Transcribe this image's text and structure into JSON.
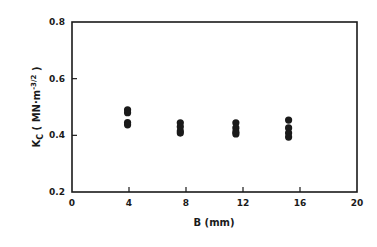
{
  "chart_data": {
    "type": "scatter",
    "title": "",
    "xlabel": "B (mm)",
    "ylabel": "K_C (MN·m^-3/2)",
    "ylabel_parts": {
      "main": "K",
      "sub": "C",
      "units_open": " ( MN·m",
      "sup": "-3/2",
      "units_close": " )"
    },
    "xlim": [
      0,
      20
    ],
    "ylim": [
      0.2,
      0.8
    ],
    "xticks": [
      0,
      4,
      8,
      12,
      16,
      20
    ],
    "yticks": [
      0.2,
      0.4,
      0.6,
      0.8
    ],
    "xtick_labels": [
      "0",
      "4",
      "8",
      "12",
      "16",
      "20"
    ],
    "ytick_labels": [
      "0.2",
      "0.4",
      "0.6",
      "0.8"
    ],
    "grid": false,
    "legend": null,
    "marker_color": "#1a1a1a",
    "series": [
      {
        "name": "K_C vs B",
        "points": [
          {
            "x": 3.9,
            "y": 0.49
          },
          {
            "x": 3.9,
            "y": 0.48
          },
          {
            "x": 3.9,
            "y": 0.445
          },
          {
            "x": 3.9,
            "y": 0.437
          },
          {
            "x": 7.6,
            "y": 0.444
          },
          {
            "x": 7.6,
            "y": 0.43
          },
          {
            "x": 7.6,
            "y": 0.415
          },
          {
            "x": 7.6,
            "y": 0.408
          },
          {
            "x": 11.5,
            "y": 0.444
          },
          {
            "x": 11.5,
            "y": 0.426
          },
          {
            "x": 11.5,
            "y": 0.412
          },
          {
            "x": 11.5,
            "y": 0.405
          },
          {
            "x": 15.2,
            "y": 0.454
          },
          {
            "x": 15.2,
            "y": 0.426
          },
          {
            "x": 15.2,
            "y": 0.408
          },
          {
            "x": 15.2,
            "y": 0.394
          }
        ]
      }
    ]
  }
}
